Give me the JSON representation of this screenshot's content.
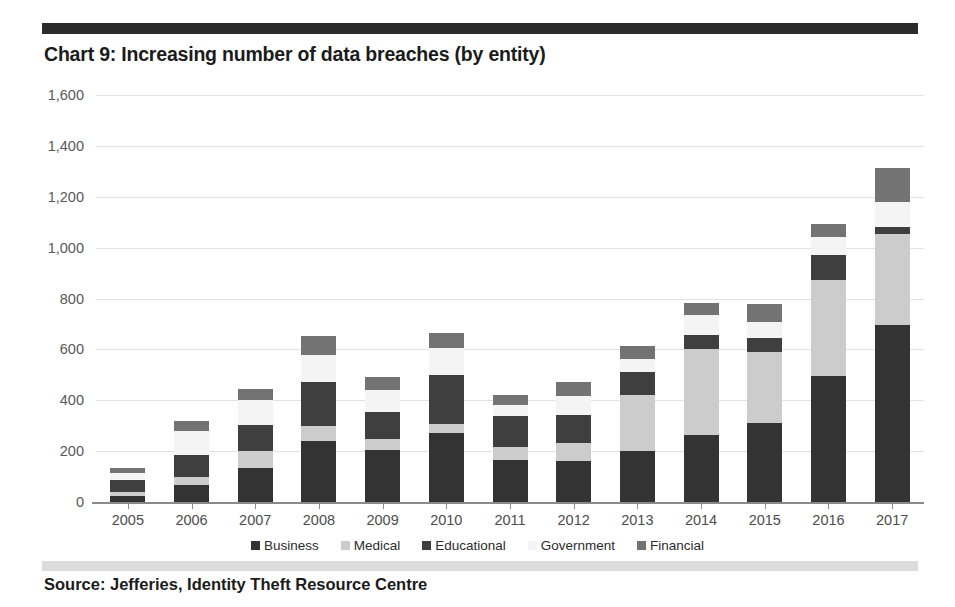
{
  "header": {
    "title": "Chart 9: Increasing number of data breaches (by entity)"
  },
  "footer": {
    "source": "Source: Jefferies, Identity Theft Resource Centre"
  },
  "colors": {
    "business": "#333333",
    "medical": "#cccccc",
    "educational": "#3f3f3f",
    "government": "#f4f4f4",
    "financial": "#737373",
    "gridline": "#e2e2e2",
    "axis": "#8a8a8a",
    "title_text": "#1b1b1b",
    "top_rule": "#2b2b2b",
    "footer_rule": "#dcdcdc"
  },
  "chart_data": {
    "type": "bar",
    "stacked": true,
    "title": "Chart 9: Increasing number of data breaches (by entity)",
    "xlabel": "",
    "ylabel": "",
    "ylim": [
      0,
      1600
    ],
    "yticks": [
      0,
      200,
      400,
      600,
      800,
      1000,
      1200,
      1400,
      1600
    ],
    "ytick_labels": [
      "0",
      "200",
      "400",
      "600",
      "800",
      "1,000",
      "1,200",
      "1,400",
      "1,600"
    ],
    "grid": true,
    "legend_position": "bottom",
    "categories": [
      "2005",
      "2006",
      "2007",
      "2008",
      "2009",
      "2010",
      "2011",
      "2012",
      "2013",
      "2014",
      "2015",
      "2016",
      "2017"
    ],
    "series": [
      {
        "name": "Business",
        "color": "#333333",
        "values": [
          22,
          65,
          134,
          239,
          204,
          271,
          166,
          160,
          200,
          264,
          312,
          495,
          694
        ]
      },
      {
        "name": "Medical",
        "color": "#cccccc",
        "values": [
          17,
          35,
          66,
          59,
          44,
          37,
          49,
          70,
          222,
          336,
          277,
          377,
          359
        ]
      },
      {
        "name": "Educational",
        "color": "#3f3f3f",
        "values": [
          48,
          84,
          104,
          172,
          105,
          193,
          123,
          111,
          88,
          57,
          57,
          98,
          27
        ]
      },
      {
        "name": "Government",
        "color": "#f4f4f4",
        "values": [
          26,
          94,
          96,
          106,
          88,
          104,
          44,
          77,
          51,
          80,
          63,
          72,
          100
        ]
      },
      {
        "name": "Financial",
        "color": "#737373",
        "values": [
          19,
          40,
          45,
          78,
          51,
          58,
          39,
          52,
          54,
          45,
          71,
          52,
          134
        ]
      }
    ],
    "totals": [
      132,
      318,
      445,
      654,
      492,
      663,
      421,
      470,
      615,
      782,
      780,
      1094,
      1314
    ]
  }
}
